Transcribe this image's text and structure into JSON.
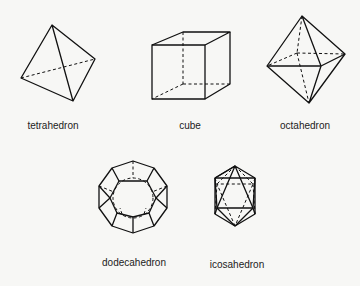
{
  "figure": {
    "shapes": [
      {
        "name": "tetrahedron",
        "label": "tetrahedron"
      },
      {
        "name": "cube",
        "label": "cube"
      },
      {
        "name": "octahedron",
        "label": "octahedron"
      },
      {
        "name": "dodecahedron",
        "label": "dodecahedron"
      },
      {
        "name": "icosahedron",
        "label": "icosahedron"
      }
    ]
  }
}
